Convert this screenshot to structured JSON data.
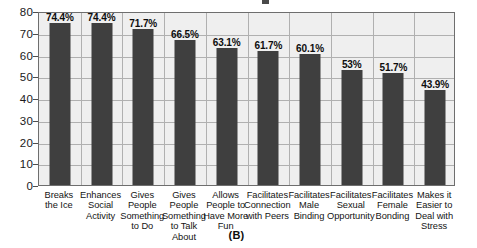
{
  "figure": {
    "caption": "(B)",
    "colors": {
      "bar": "#3f3f3f",
      "plot_background": "#efefef",
      "gridline": "#b0b0b0",
      "axis": "#6e6e6e",
      "text": "#111111"
    }
  },
  "chart_data": {
    "type": "bar",
    "title": "",
    "subtitle": "",
    "xlabel": "",
    "ylabel": "",
    "ylim": [
      0,
      80
    ],
    "ytick_step": 10,
    "yticks": [
      0,
      10,
      20,
      30,
      40,
      50,
      60,
      70,
      80
    ],
    "ytick_labels": [
      "0",
      "10",
      "20",
      "30",
      "40",
      "50",
      "60",
      "70",
      "80"
    ],
    "grid": "horizontal-and-vertical",
    "legend": "none",
    "categories": [
      "Breaks the Ice",
      "Enhances Social Activity",
      "Gives People Something to Do",
      "Gives People Something to Talk About",
      "Allows People to Have More Fun",
      "Facilitates Connection with Peers",
      "Facilitates Male Binding",
      "Facilitates Sexual Opportunity",
      "Facilitates Female Bonding",
      "Makes it Easier to Deal with Stress"
    ],
    "category_lines": [
      [
        "Breaks",
        "the Ice"
      ],
      [
        "Enhances",
        "Social",
        "Activity"
      ],
      [
        "Gives",
        "People",
        "Something",
        "to Do"
      ],
      [
        "Gives",
        "People",
        "Something",
        "to Talk About"
      ],
      [
        "Allows",
        "People to",
        "Have More",
        "Fun"
      ],
      [
        "Facilitates",
        "Connection",
        "with Peers"
      ],
      [
        "Facilitates",
        "Male",
        "Binding"
      ],
      [
        "Facilitates",
        "Sexual",
        "Opportunity"
      ],
      [
        "Facilitates",
        "Female",
        "Bonding"
      ],
      [
        "Makes it",
        "Easier to",
        "Deal with",
        "Stress"
      ]
    ],
    "values": [
      74.4,
      74.4,
      71.7,
      66.5,
      63.1,
      61.7,
      60.1,
      53,
      51.7,
      43.9
    ],
    "value_labels": [
      "74.4%",
      "74.4%",
      "71.7%",
      "66.5%",
      "63.1%",
      "61.7%",
      "60.1%",
      "53%",
      "51.7%",
      "43.9%"
    ]
  }
}
